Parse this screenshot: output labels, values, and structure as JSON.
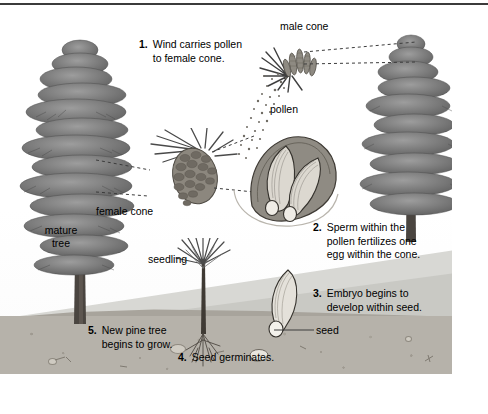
{
  "figure": {
    "type": "illustrated-diagram"
  },
  "labels": {
    "male_cone": "male cone",
    "pollen": "pollen",
    "female_cone": "female cone",
    "mature_tree": "mature\ntree",
    "mature_tree_line1": "mature",
    "mature_tree_line2": "tree",
    "seedling": "seedling",
    "seed": "seed"
  },
  "steps": [
    {
      "number": "1.",
      "text": "Wind carries pollen\nto female cone."
    },
    {
      "number": "2.",
      "text": "Sperm within the\npollen fertilizes one\negg within the cone."
    },
    {
      "number": "3.",
      "text": "Embryo begins to\ndevelop within seed."
    },
    {
      "number": "4.",
      "text": "Seed germinates."
    },
    {
      "number": "5.",
      "text": "New pine tree\nbegins to grow."
    }
  ],
  "colors": {
    "ink": "#000000",
    "border": "#3b3b3b",
    "leader": "#3c3c3c",
    "foliage_dark": "#5e5e5e",
    "foliage_mid": "#8a8a8a",
    "foliage_light": "#b4b4b4",
    "trunk": "#4a4540",
    "cone_dark": "#6e6a62",
    "cone_light": "#a9a49a",
    "soil": "#b6b2aa",
    "soil_dark": "#a8a49c",
    "hill_far": "#d8d8d4",
    "hill_mid": "#c9c9c4",
    "sky": "#ffffff"
  }
}
